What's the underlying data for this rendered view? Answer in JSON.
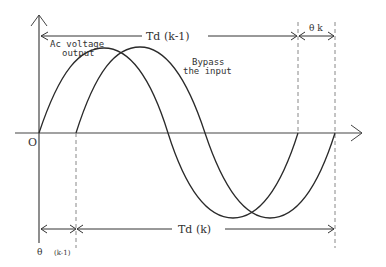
{
  "diagram": {
    "title": "",
    "colors": {
      "curve": "#2a2a2a",
      "axis": "#444444",
      "dashed": "#888888",
      "text": "#333333",
      "background": "#ffffff"
    },
    "axes": {
      "origin_label": "O"
    },
    "curves": [
      {
        "id": "ac-voltage-output",
        "label_line1": "Ac voltage",
        "label_line2": "output"
      },
      {
        "id": "bypass-input",
        "label_line1": "Bypass",
        "label_line2": "the input"
      }
    ],
    "dimensions": {
      "td_prev": "Td (k-1)",
      "theta_k": "θ k",
      "td_k": "Td (k)",
      "theta_prev_symbol": "θ",
      "theta_prev_sub": "(k-1)"
    }
  }
}
